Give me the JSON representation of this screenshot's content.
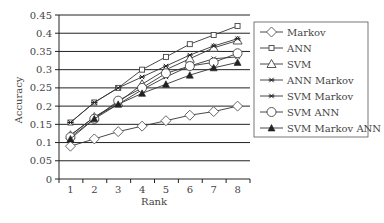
{
  "chart_data": {
    "type": "line",
    "title": "",
    "xlabel": "Rank",
    "ylabel": "Accuracy",
    "categories": [
      "1",
      "2",
      "3",
      "4",
      "5",
      "6",
      "7",
      "8"
    ],
    "ylim": [
      0,
      0.45
    ],
    "yticks": [
      "0",
      "0.05",
      "0.1",
      "0.15",
      "0.2",
      "0.25",
      "0.3",
      "0.35",
      "0.4",
      "0.45"
    ],
    "ytick_values": [
      0,
      0.05,
      0.1,
      0.15,
      0.2,
      0.25,
      0.3,
      0.35,
      0.4,
      0.45
    ],
    "grid": "horizontal",
    "legend_position": "right",
    "series": [
      {
        "name": "Markov",
        "marker": "diamond-open",
        "values": [
          0.09,
          0.11,
          0.13,
          0.145,
          0.16,
          0.175,
          0.185,
          0.2
        ]
      },
      {
        "name": "ANN",
        "marker": "square-open",
        "values": [
          0.155,
          0.21,
          0.25,
          0.3,
          0.335,
          0.37,
          0.395,
          0.42
        ]
      },
      {
        "name": "SVM",
        "marker": "triangle-open",
        "values": [
          0.12,
          0.17,
          0.21,
          0.26,
          0.3,
          0.33,
          0.36,
          0.38
        ]
      },
      {
        "name": "ANN Markov",
        "marker": "star",
        "values": [
          0.155,
          0.21,
          0.25,
          0.28,
          0.31,
          0.34,
          0.365,
          0.385
        ]
      },
      {
        "name": "SVM Markov",
        "marker": "star",
        "values": [
          0.12,
          0.17,
          0.205,
          0.245,
          0.28,
          0.31,
          0.33,
          0.335
        ]
      },
      {
        "name": "SVM ANN",
        "marker": "circle-open",
        "values": [
          0.115,
          0.165,
          0.215,
          0.25,
          0.29,
          0.31,
          0.32,
          0.345
        ]
      },
      {
        "name": "SVM Markov ANN",
        "marker": "triangle-filled",
        "values": [
          0.11,
          0.165,
          0.205,
          0.235,
          0.26,
          0.285,
          0.305,
          0.32
        ]
      }
    ]
  }
}
